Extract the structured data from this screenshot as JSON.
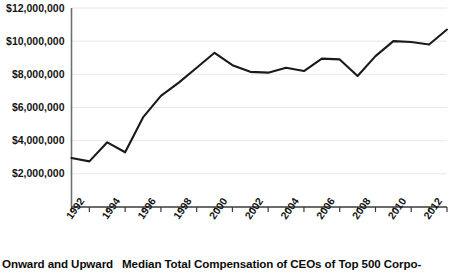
{
  "caption": {
    "lead": "Onward and Upward",
    "body": "Median Total Compensation of CEOs of Top 500 Corpo-"
  },
  "chart_data": {
    "type": "line",
    "title": "",
    "xlabel": "",
    "ylabel": "",
    "ylim": [
      0,
      12000000
    ],
    "xlim": [
      1992,
      2013
    ],
    "grid": true,
    "legend": false,
    "line_color": "#1a1a1a",
    "gridline_color": "#e8e8e8",
    "axis_color": "#6e6e6e",
    "y_ticks": [
      2000000,
      4000000,
      6000000,
      8000000,
      10000000,
      12000000
    ],
    "y_tick_labels": [
      "$2,000,000",
      "$4,000,000",
      "$6,000,000",
      "$8,000,000",
      "$10,000,000",
      "$12,000,000"
    ],
    "x_ticks": [
      1992,
      1993,
      1994,
      1995,
      1996,
      1997,
      1998,
      1999,
      2000,
      2001,
      2002,
      2003,
      2004,
      2005,
      2006,
      2007,
      2008,
      2009,
      2010,
      2011,
      2012,
      2013
    ],
    "x_tick_labels": [
      "1992",
      "1994",
      "1996",
      "1998",
      "2000",
      "2002",
      "2004",
      "2006",
      "2008",
      "2010",
      "2012"
    ],
    "x": [
      1992,
      1993,
      1994,
      1995,
      1996,
      1997,
      1998,
      1999,
      2000,
      2001,
      2002,
      2003,
      2004,
      2005,
      2006,
      2007,
      2008,
      2009,
      2010,
      2011,
      2012,
      2013
    ],
    "values": [
      2950000,
      2750000,
      3900000,
      3300000,
      5400000,
      6700000,
      7500000,
      8400000,
      9300000,
      8550000,
      8150000,
      8100000,
      8400000,
      8200000,
      8950000,
      8900000,
      7900000,
      9100000,
      10000000,
      9950000,
      9800000,
      10700000
    ],
    "series": [
      {
        "name": "Median Total Compensation",
        "values": [
          2950000,
          2750000,
          3900000,
          3300000,
          5400000,
          6700000,
          7500000,
          8400000,
          9300000,
          8550000,
          8150000,
          8100000,
          8400000,
          8200000,
          8950000,
          8900000,
          7900000,
          9100000,
          10000000,
          9950000,
          9800000,
          10700000
        ]
      }
    ]
  }
}
